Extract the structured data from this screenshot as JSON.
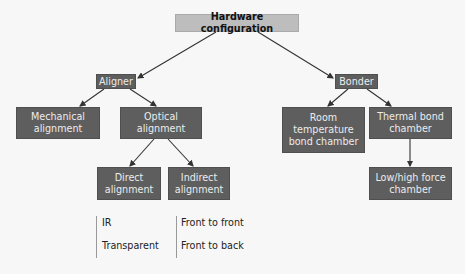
{
  "diagram": {
    "root": "Hardware configuration",
    "aligner": {
      "label": "Aligner",
      "children": [
        "Mechanical\nalignment",
        "Optical\nalignment"
      ],
      "optical_children": [
        "Direct\nalignment",
        "Indirect\nalignment"
      ],
      "direct_options": [
        "IR",
        "Transparent"
      ],
      "indirect_options": [
        "Front to front",
        "Front to back"
      ]
    },
    "bonder": {
      "label": "Bonder",
      "children": [
        "Room\ntemperature\nbond chamber",
        "Thermal bond\nchamber"
      ],
      "thermal_children": [
        "Low/high force\nchamber"
      ]
    }
  },
  "colors": {
    "root_fill": "#bdbdbd",
    "node_fill": "#5e5e5e",
    "node_text": "#ececec",
    "edge": "#333333"
  }
}
